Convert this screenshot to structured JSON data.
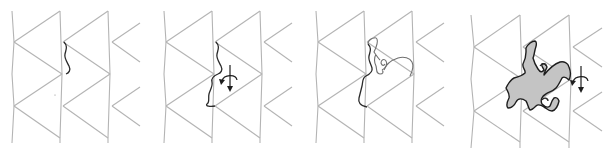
{
  "figure": {
    "colors": {
      "grid": "#b4b4b4",
      "outline": "#2a2a2a",
      "fill": "#c4c4c4",
      "background": "#ffffff"
    },
    "panels": [
      {
        "step": 1,
        "content": "triangular grid with first edge curve"
      },
      {
        "step": 2,
        "content": "edge curve rotated with rotation-arrow-icon"
      },
      {
        "step": 3,
        "content": "partial rider outline drawn"
      },
      {
        "step": 4,
        "content": "filled horseman tile with rotation-arrow-icon"
      }
    ]
  }
}
